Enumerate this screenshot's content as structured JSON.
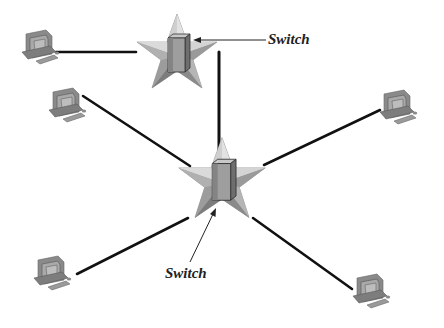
{
  "diagram": {
    "type": "star-topology-network",
    "labels": {
      "top_switch": "Switch",
      "center_switch": "Switch"
    },
    "nodes": {
      "switches": [
        {
          "id": "top_switch",
          "cx": 177,
          "cy": 57
        },
        {
          "id": "center_switch",
          "cx": 222,
          "cy": 184
        }
      ],
      "computers": [
        {
          "id": "pc_top_left",
          "x": 38,
          "y": 50
        },
        {
          "id": "pc_mid_left",
          "x": 62,
          "y": 106
        },
        {
          "id": "pc_right",
          "x": 405,
          "y": 108
        },
        {
          "id": "pc_bottom_left",
          "x": 53,
          "y": 276
        },
        {
          "id": "pc_bottom_right",
          "x": 372,
          "y": 292
        }
      ]
    },
    "colors": {
      "line": "#111111",
      "star_light": "#d8d8d8",
      "star_mid": "#a8a8a8",
      "star_dark": "#7a7a7a",
      "device": "#8c8c8c",
      "text": "#222222"
    }
  }
}
